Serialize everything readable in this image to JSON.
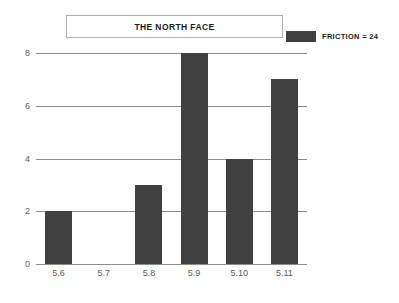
{
  "chart_data": {
    "type": "bar",
    "title": "THE NORTH FACE",
    "categories": [
      "5.6",
      "5.7",
      "5.8",
      "5.9",
      "5.10",
      "5.11"
    ],
    "values": [
      2,
      0,
      3,
      8,
      4,
      7
    ],
    "series": [
      {
        "name": "FRICTION = 24",
        "values": [
          2,
          0,
          3,
          8,
          4,
          7
        ],
        "color": "#404040"
      }
    ],
    "xlabel": "",
    "ylabel": "",
    "ylim": [
      0,
      8
    ],
    "yticks": [
      0,
      2,
      4,
      6,
      8
    ],
    "ytick_labels": [
      "0",
      "2",
      "4",
      "6",
      "8"
    ],
    "grid": true,
    "grid_axis": "y",
    "legend": {
      "position": "top-right",
      "entries": [
        {
          "label": "FRICTION = 24",
          "color": "#404040"
        }
      ]
    },
    "colors": {
      "bar": "#404040",
      "gridline": "#8c8c8c",
      "tick_label": "#5a5a5a",
      "title_text": "#1a1a1a",
      "title_border": "#b0b0b0",
      "background": "#ffffff"
    }
  }
}
